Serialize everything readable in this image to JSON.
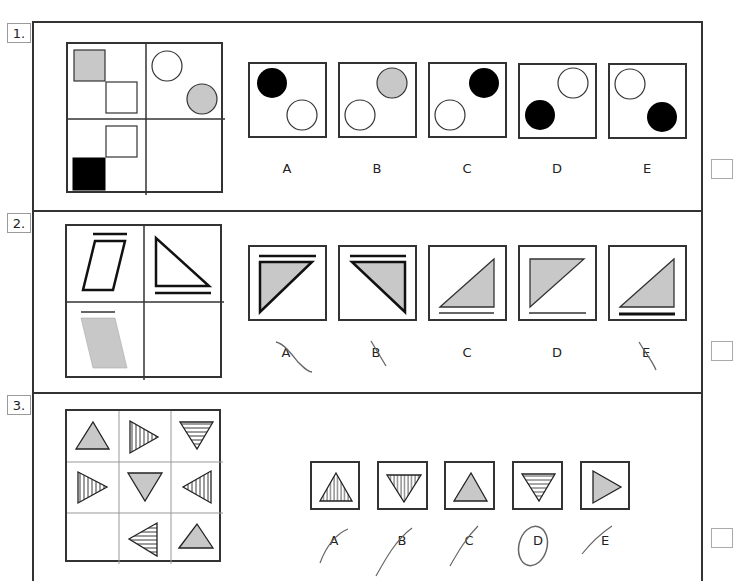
{
  "questions": [
    {
      "number": "1.",
      "options": [
        {
          "label": "A",
          "description": "black circle top-left, white circle bottom-right"
        },
        {
          "label": "B",
          "description": "grey circle top-right, white circle bottom-left"
        },
        {
          "label": "C",
          "description": "black circle top-right, white circle bottom-left"
        },
        {
          "label": "D",
          "description": "white circle top-right, black circle bottom-left"
        },
        {
          "label": "E",
          "description": "white circle top-left, black circle bottom-right"
        }
      ],
      "grid": "2x2: grey square + white square (diagonal), white circle + grey circle (diagonal), white square + black square (diagonal), empty"
    },
    {
      "number": "2.",
      "options": [
        {
          "label": "A",
          "description": "thick line above, grey triangle (right angle top-left) thick outline"
        },
        {
          "label": "B",
          "description": "thick line above, grey triangle (right angle top-right) thick outline"
        },
        {
          "label": "C",
          "description": "grey triangle thin outline, thin line below"
        },
        {
          "label": "D",
          "description": "grey triangle (right angle top-left) thin outline, thin line below"
        },
        {
          "label": "E",
          "description": "grey triangle thin outline, thick line below"
        }
      ],
      "grid": "2x2: parallelogram thick outline with line above, triangle thick outline with line below, grey parallelogram with thin line above, empty"
    },
    {
      "number": "3.",
      "options": [
        {
          "label": "A",
          "description": "upward triangle vertical stripes"
        },
        {
          "label": "B",
          "description": "downward triangle vertical stripes"
        },
        {
          "label": "C",
          "description": "upward grey triangle"
        },
        {
          "label": "D",
          "description": "downward triangle horizontal stripes",
          "circled": true
        },
        {
          "label": "E",
          "description": "right-pointing grey triangle"
        }
      ],
      "grid": "3x3 triangles grid with empty bottom-left cell"
    }
  ],
  "colors": {
    "grey_fill": "#c8c8c8",
    "black_fill": "#000000",
    "border": "#333333"
  }
}
